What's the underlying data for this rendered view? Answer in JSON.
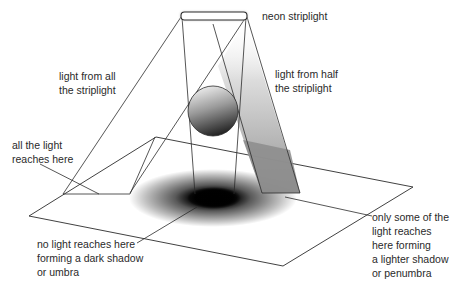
{
  "diagram": {
    "type": "shadow-formation",
    "colors": {
      "line": "#2b2b2b",
      "umbra": "#000000",
      "penumbra_band": "#8c8c8c",
      "sphere_dark": "#2a2a2a",
      "sphere_light": "#e8e8e8",
      "background": "#ffffff"
    },
    "labels": {
      "neon_striplight": "neon striplight",
      "light_from_all": "light from all\nthe striplight",
      "light_from_half": "light from half\nthe striplight",
      "all_light_reaches": "all the light\nreaches here",
      "no_light_reaches": "no light reaches here\nforming a dark shadow\nor umbra",
      "some_light_reaches": "only some of the\nlight reaches\nhere forming\na lighter shadow\nor penumbra"
    }
  }
}
